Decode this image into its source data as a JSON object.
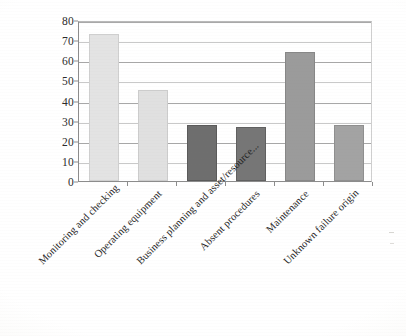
{
  "chart_data": {
    "type": "bar",
    "title": "",
    "subtitle": "",
    "xlabel": "",
    "ylabel": "",
    "ylim": [
      0,
      80
    ],
    "ytick_step": 10,
    "yticks": [
      "0",
      "10",
      "20",
      "30",
      "40",
      "50",
      "60",
      "70",
      "80"
    ],
    "grid": true,
    "legend": "none",
    "categories": [
      "Monitoring and checking",
      "Operating equipment",
      "Business planning and asset/resource...",
      "Absent procedures",
      "Maintenance",
      "Unknown failure origin"
    ],
    "values": [
      73,
      45,
      28,
      27,
      64,
      28
    ],
    "bar_colors": [
      "#e3e3e3",
      "#e0e0e0",
      "#6e6e6e",
      "#767676",
      "#9b9b9b",
      "#a3a3a3"
    ],
    "bar_border_colors": [
      "#cfcfcf",
      "#cccccc",
      "#5a5a5a",
      "#606060",
      "#878787",
      "#8f8f8f"
    ]
  },
  "axis": {
    "y_axis_name": "y-axis",
    "x_axis_name": "x-axis"
  }
}
